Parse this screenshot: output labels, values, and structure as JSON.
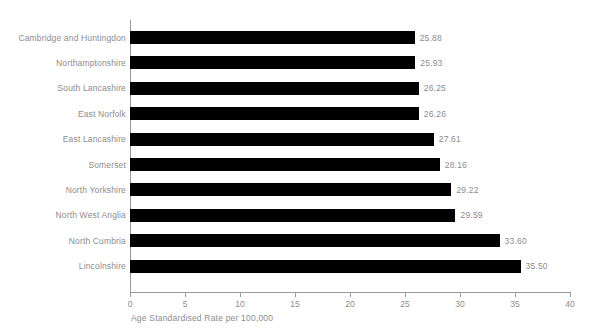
{
  "chart_data": {
    "type": "bar",
    "orientation": "horizontal",
    "title": "",
    "xlabel": "Age Standardised Rate per 100,000",
    "ylabel": "",
    "xlim": [
      0,
      40
    ],
    "xticks": [
      0,
      5,
      10,
      15,
      20,
      25,
      30,
      35,
      40
    ],
    "xtick_labels": [
      "0",
      "5",
      "10",
      "15",
      "20",
      "25",
      "30",
      "35",
      "40"
    ],
    "grid": false,
    "legend": null,
    "bar_color": "#000000",
    "text_color": "#8d8d8d",
    "axis_color": "#9a9a9a",
    "categories": [
      "Cambridge and Huntingdon",
      "Northamptonshire",
      "South Lancashire",
      "East Norfolk",
      "East Lancashire",
      "Somerset",
      "North Yorkshire",
      "North West Anglia",
      "North Cumbria",
      "Lincolnshire"
    ],
    "values": [
      25.88,
      25.93,
      26.25,
      26.26,
      27.61,
      28.16,
      29.22,
      29.59,
      33.6,
      35.5
    ],
    "value_labels": [
      "25.88",
      "25.93",
      "26.25",
      "26.26",
      "27.61",
      "28.16",
      "29.22",
      "29.59",
      "33.60",
      "35.50"
    ]
  }
}
